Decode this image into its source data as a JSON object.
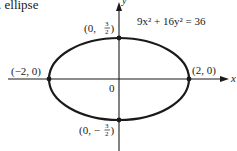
{
  "caption": ". ellipse",
  "equation": "9x² + 16y² = 36",
  "axes": {
    "x_label": "x",
    "y_label": "y",
    "origin_label": "0"
  },
  "points": {
    "top": {
      "label": "(0, 3/2)",
      "pre": "(0, ",
      "num": "3",
      "den": "2",
      "post": ")"
    },
    "bottom": {
      "label": "(0, −3/2)",
      "pre": "(0, −",
      "num": "3",
      "den": "2",
      "post": ")"
    },
    "left": {
      "label": "(−2, 0)"
    },
    "right": {
      "label": "(2, 0)"
    }
  },
  "colors": {
    "stroke": "#1a1a1a",
    "background": "#ffffff"
  }
}
